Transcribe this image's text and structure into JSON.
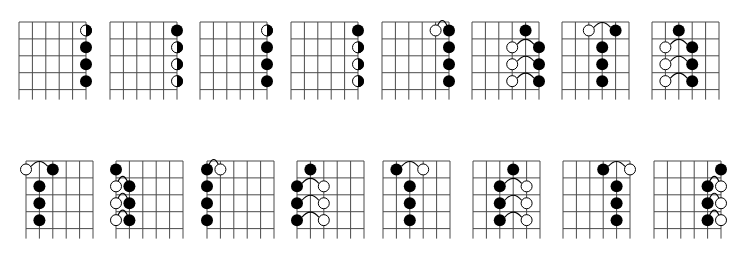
{
  "figure": {
    "width": 747,
    "height": 256,
    "background": "#ffffff",
    "line_color": "#4a4a4a",
    "dot_color": "#000000",
    "open_fill": "#ffffff"
  },
  "geometry": {
    "strings": 6,
    "frets": 4,
    "string_spacing": 13.4,
    "fret_spacing": 16.9,
    "tail": 10,
    "dot_radius": 6
  },
  "legend_symbols": {
    "black": "filled note",
    "open": "open (hollow) note",
    "half": "half-filled note (left white, right black)",
    "tie": "slur arc connecting two notes"
  },
  "rows": [
    {
      "name": "top-row",
      "diagrams": [
        {
          "x": 19,
          "y": 22,
          "dots": [
            {
              "s": 6,
              "f": 1,
              "t": "half"
            },
            {
              "s": 6,
              "f": 2,
              "t": "black"
            },
            {
              "s": 6,
              "f": 3,
              "t": "black"
            },
            {
              "s": 6,
              "f": 4,
              "t": "black"
            }
          ],
          "ties": []
        },
        {
          "x": 110,
          "y": 22,
          "dots": [
            {
              "s": 6,
              "f": 1,
              "t": "black"
            },
            {
              "s": 6,
              "f": 2,
              "t": "half"
            },
            {
              "s": 6,
              "f": 3,
              "t": "half"
            },
            {
              "s": 6,
              "f": 4,
              "t": "half"
            }
          ],
          "ties": []
        },
        {
          "x": 200,
          "y": 22,
          "dots": [
            {
              "s": 6,
              "f": 1,
              "t": "half"
            },
            {
              "s": 6,
              "f": 2,
              "t": "black"
            },
            {
              "s": 6,
              "f": 3,
              "t": "black"
            },
            {
              "s": 6,
              "f": 4,
              "t": "black"
            }
          ],
          "ties": []
        },
        {
          "x": 291,
          "y": 22,
          "dots": [
            {
              "s": 6,
              "f": 1,
              "t": "black"
            },
            {
              "s": 6,
              "f": 2,
              "t": "half"
            },
            {
              "s": 6,
              "f": 3,
              "t": "half"
            },
            {
              "s": 6,
              "f": 4,
              "t": "half"
            }
          ],
          "ties": []
        },
        {
          "x": 382,
          "y": 22,
          "dots": [
            {
              "s": 5,
              "f": 1,
              "t": "open"
            },
            {
              "s": 6,
              "f": 1,
              "t": "black"
            },
            {
              "s": 6,
              "f": 2,
              "t": "black"
            },
            {
              "s": 6,
              "f": 3,
              "t": "black"
            },
            {
              "s": 6,
              "f": 4,
              "t": "black"
            }
          ],
          "ties": [
            {
              "f": 1,
              "from": 5,
              "to": 6
            }
          ]
        },
        {
          "x": 472,
          "y": 22,
          "dots": [
            {
              "s": 5,
              "f": 1,
              "t": "black"
            },
            {
              "s": 4,
              "f": 2,
              "t": "open"
            },
            {
              "s": 6,
              "f": 2,
              "t": "black"
            },
            {
              "s": 4,
              "f": 3,
              "t": "open"
            },
            {
              "s": 6,
              "f": 3,
              "t": "black"
            },
            {
              "s": 4,
              "f": 4,
              "t": "open"
            },
            {
              "s": 6,
              "f": 4,
              "t": "black"
            }
          ],
          "ties": [
            {
              "f": 2,
              "from": 4,
              "to": 6
            },
            {
              "f": 3,
              "from": 4,
              "to": 6
            },
            {
              "f": 4,
              "from": 4,
              "to": 6
            }
          ]
        },
        {
          "x": 562,
          "y": 22,
          "dots": [
            {
              "s": 3,
              "f": 1,
              "t": "open"
            },
            {
              "s": 5,
              "f": 1,
              "t": "black"
            },
            {
              "s": 4,
              "f": 2,
              "t": "black"
            },
            {
              "s": 4,
              "f": 3,
              "t": "black"
            },
            {
              "s": 4,
              "f": 4,
              "t": "black"
            }
          ],
          "ties": [
            {
              "f": 1,
              "from": 3,
              "to": 5
            }
          ]
        },
        {
          "x": 652,
          "y": 22,
          "dots": [
            {
              "s": 3,
              "f": 1,
              "t": "black"
            },
            {
              "s": 2,
              "f": 2,
              "t": "open"
            },
            {
              "s": 4,
              "f": 2,
              "t": "black"
            },
            {
              "s": 2,
              "f": 3,
              "t": "open"
            },
            {
              "s": 4,
              "f": 3,
              "t": "black"
            },
            {
              "s": 2,
              "f": 4,
              "t": "open"
            },
            {
              "s": 4,
              "f": 4,
              "t": "black"
            }
          ],
          "ties": [
            {
              "f": 2,
              "from": 2,
              "to": 4
            },
            {
              "f": 3,
              "from": 2,
              "to": 4
            },
            {
              "f": 4,
              "from": 2,
              "to": 4
            }
          ]
        }
      ]
    },
    {
      "name": "bottom-row",
      "diagrams": [
        {
          "x": 26,
          "y": 161,
          "dots": [
            {
              "s": 1,
              "f": 1,
              "t": "open"
            },
            {
              "s": 3,
              "f": 1,
              "t": "black"
            },
            {
              "s": 2,
              "f": 2,
              "t": "black"
            },
            {
              "s": 2,
              "f": 3,
              "t": "black"
            },
            {
              "s": 2,
              "f": 4,
              "t": "black"
            }
          ],
          "ties": [
            {
              "f": 1,
              "from": 1,
              "to": 3
            }
          ]
        },
        {
          "x": 116,
          "y": 161,
          "dots": [
            {
              "s": 1,
              "f": 1,
              "t": "black"
            },
            {
              "s": 1,
              "f": 2,
              "t": "open"
            },
            {
              "s": 2,
              "f": 2,
              "t": "black"
            },
            {
              "s": 1,
              "f": 3,
              "t": "open"
            },
            {
              "s": 2,
              "f": 3,
              "t": "black"
            },
            {
              "s": 1,
              "f": 4,
              "t": "open"
            },
            {
              "s": 2,
              "f": 4,
              "t": "black"
            }
          ],
          "ties": [
            {
              "f": 2,
              "from": 1,
              "to": 2
            },
            {
              "f": 3,
              "from": 1,
              "to": 2
            },
            {
              "f": 4,
              "from": 1,
              "to": 2
            }
          ]
        },
        {
          "x": 207,
          "y": 161,
          "dots": [
            {
              "s": 1,
              "f": 1,
              "t": "black"
            },
            {
              "s": 2,
              "f": 1,
              "t": "open"
            },
            {
              "s": 1,
              "f": 2,
              "t": "black"
            },
            {
              "s": 1,
              "f": 3,
              "t": "black"
            },
            {
              "s": 1,
              "f": 4,
              "t": "black"
            }
          ],
          "ties": [
            {
              "f": 1,
              "from": 1,
              "to": 2
            }
          ]
        },
        {
          "x": 297,
          "y": 161,
          "dots": [
            {
              "s": 2,
              "f": 1,
              "t": "black"
            },
            {
              "s": 1,
              "f": 2,
              "t": "black"
            },
            {
              "s": 3,
              "f": 2,
              "t": "open"
            },
            {
              "s": 1,
              "f": 3,
              "t": "black"
            },
            {
              "s": 3,
              "f": 3,
              "t": "open"
            },
            {
              "s": 1,
              "f": 4,
              "t": "black"
            },
            {
              "s": 3,
              "f": 4,
              "t": "open"
            }
          ],
          "ties": [
            {
              "f": 2,
              "from": 1,
              "to": 3
            },
            {
              "f": 3,
              "from": 1,
              "to": 3
            },
            {
              "f": 4,
              "from": 1,
              "to": 3
            }
          ]
        },
        {
          "x": 383,
          "y": 161,
          "dots": [
            {
              "s": 2,
              "f": 1,
              "t": "black"
            },
            {
              "s": 4,
              "f": 1,
              "t": "open"
            },
            {
              "s": 3,
              "f": 2,
              "t": "black"
            },
            {
              "s": 3,
              "f": 3,
              "t": "black"
            },
            {
              "s": 3,
              "f": 4,
              "t": "black"
            }
          ],
          "ties": [
            {
              "f": 1,
              "from": 2,
              "to": 4
            }
          ]
        },
        {
          "x": 473,
          "y": 161,
          "dots": [
            {
              "s": 4,
              "f": 1,
              "t": "black"
            },
            {
              "s": 3,
              "f": 2,
              "t": "black"
            },
            {
              "s": 5,
              "f": 2,
              "t": "open"
            },
            {
              "s": 3,
              "f": 3,
              "t": "black"
            },
            {
              "s": 5,
              "f": 3,
              "t": "open"
            },
            {
              "s": 3,
              "f": 4,
              "t": "black"
            },
            {
              "s": 5,
              "f": 4,
              "t": "open"
            }
          ],
          "ties": [
            {
              "f": 2,
              "from": 3,
              "to": 5
            },
            {
              "f": 3,
              "from": 3,
              "to": 5
            },
            {
              "f": 4,
              "from": 3,
              "to": 5
            }
          ]
        },
        {
          "x": 563,
          "y": 161,
          "dots": [
            {
              "s": 4,
              "f": 1,
              "t": "black"
            },
            {
              "s": 6,
              "f": 1,
              "t": "open"
            },
            {
              "s": 5,
              "f": 2,
              "t": "black"
            },
            {
              "s": 5,
              "f": 3,
              "t": "black"
            },
            {
              "s": 5,
              "f": 4,
              "t": "black"
            }
          ],
          "ties": [
            {
              "f": 1,
              "from": 4,
              "to": 6
            }
          ]
        },
        {
          "x": 654,
          "y": 161,
          "dots": [
            {
              "s": 6,
              "f": 1,
              "t": "black"
            },
            {
              "s": 5,
              "f": 2,
              "t": "black"
            },
            {
              "s": 6,
              "f": 2,
              "t": "open"
            },
            {
              "s": 5,
              "f": 3,
              "t": "black"
            },
            {
              "s": 6,
              "f": 3,
              "t": "open"
            },
            {
              "s": 5,
              "f": 4,
              "t": "black"
            },
            {
              "s": 6,
              "f": 4,
              "t": "open"
            }
          ],
          "ties": [
            {
              "f": 2,
              "from": 5,
              "to": 6
            },
            {
              "f": 3,
              "from": 5,
              "to": 6
            },
            {
              "f": 4,
              "from": 5,
              "to": 6
            }
          ]
        }
      ]
    }
  ]
}
